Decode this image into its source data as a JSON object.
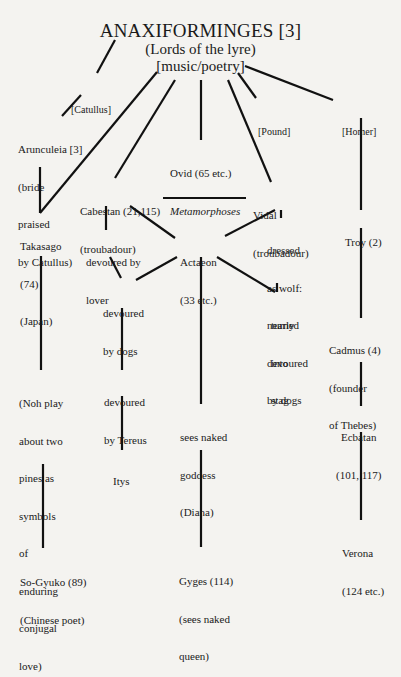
{
  "title": {
    "name": "ANAXIFORMINGES [3]",
    "subtitle": "(Lords of the lyre)",
    "category": "[music/poetry]"
  },
  "nodes": {
    "catullus": {
      "lines": [
        "[Catullus]"
      ]
    },
    "pound": {
      "lines": [
        "[Pound]"
      ]
    },
    "homer": {
      "lines": [
        "[Homer]"
      ]
    },
    "arunculeia": {
      "lines": [
        "Arunculeia [3]",
        "(bride",
        "praised",
        "by Catullus)"
      ]
    },
    "ovid": {
      "lines": [
        "Ovid (65 etc.)",
        "Metamorphoses"
      ]
    },
    "cabestan": {
      "lines": [
        "Cabestan (21,115)",
        "(troubadour)"
      ]
    },
    "vidal": {
      "lines": [
        "Vidal",
        "(troubadour)"
      ]
    },
    "takasago": {
      "lines": [
        "Takasago",
        "(74)",
        "(Japan)"
      ]
    },
    "devoured_by_lover": {
      "lines": [
        "devoured by",
        "lover"
      ]
    },
    "actaeon": {
      "lines": [
        "Actaeon",
        "(33 etc.)"
      ]
    },
    "dressed_as_wolf": {
      "lines": [
        "dressed",
        "as wolf:",
        "nearly",
        "devoured",
        "by dogs"
      ]
    },
    "troy": {
      "lines": [
        "Troy (2)"
      ]
    },
    "devoured_by_dogs": {
      "lines": [
        "devoured",
        "by dogs"
      ]
    },
    "turned_into_stag": {
      "lines": [
        "turned",
        "into",
        "stag"
      ]
    },
    "cadmus": {
      "lines": [
        "Cadmus (4)",
        "(founder",
        "of Thebes)"
      ]
    },
    "noh_play": {
      "lines": [
        "(Noh play",
        "about two",
        "pines as",
        "symbols",
        "of",
        "enduring",
        "conjugal",
        "love)"
      ]
    },
    "devoured_by_tereus": {
      "lines": [
        "devoured",
        "by Tereus"
      ]
    },
    "sees_naked_goddess": {
      "lines": [
        "sees naked",
        "goddess",
        "(Diana)"
      ]
    },
    "ecbatan": {
      "lines": [
        "Ecbatan",
        "(101, 117)"
      ]
    },
    "itys": {
      "lines": [
        "Itys"
      ]
    },
    "verona": {
      "lines": [
        "Verona",
        "(124 etc.)"
      ]
    },
    "so_gyuko": {
      "lines": [
        "So-Gyuko (89)",
        "(Chinese poet)"
      ]
    },
    "gyges": {
      "lines": [
        "Gyges (114)",
        "(sees naked",
        "queen)"
      ]
    }
  },
  "edges": [
    {
      "from": "title",
      "to": "catullus"
    },
    {
      "from": "title",
      "to": "takasago"
    },
    {
      "from": "title",
      "to": "cabestan"
    },
    {
      "from": "title",
      "to": "ovid"
    },
    {
      "from": "title",
      "to": "vidal"
    },
    {
      "from": "title",
      "to": "pound"
    },
    {
      "from": "title",
      "to": "homer"
    },
    {
      "from": "catullus",
      "to": "arunculeia"
    },
    {
      "from": "arunculeia",
      "to": "takasago"
    },
    {
      "from": "cabestan",
      "to": "vidal"
    },
    {
      "from": "cabestan",
      "to": "devoured_by_lover"
    },
    {
      "from": "cabestan",
      "to": "actaeon"
    },
    {
      "from": "vidal",
      "to": "actaeon"
    },
    {
      "from": "vidal",
      "to": "dressed_as_wolf"
    },
    {
      "from": "homer",
      "to": "troy"
    },
    {
      "from": "devoured_by_lover",
      "to": "devoured_by_dogs"
    },
    {
      "from": "actaeon",
      "to": "devoured_by_dogs"
    },
    {
      "from": "actaeon",
      "to": "turned_into_stag"
    },
    {
      "from": "dressed_as_wolf",
      "to": "turned_into_stag"
    },
    {
      "from": "actaeon",
      "to": "sees_naked_goddess"
    },
    {
      "from": "troy",
      "to": "cadmus"
    },
    {
      "from": "takasago",
      "to": "noh_play"
    },
    {
      "from": "devoured_by_dogs",
      "to": "devoured_by_tereus"
    },
    {
      "from": "cadmus",
      "to": "ecbatan"
    },
    {
      "from": "devoured_by_tereus",
      "to": "itys"
    },
    {
      "from": "ecbatan",
      "to": "verona"
    },
    {
      "from": "noh_play",
      "to": "so_gyuko"
    },
    {
      "from": "sees_naked_goddess",
      "to": "gyges"
    }
  ]
}
